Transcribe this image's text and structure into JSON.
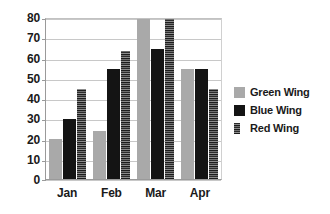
{
  "chart_data": {
    "type": "bar",
    "title": "",
    "subtitle": "",
    "xlabel": "",
    "ylabel": "",
    "categories": [
      "Jan",
      "Feb",
      "Mar",
      "Apr"
    ],
    "series": [
      {
        "name": "Green Wing",
        "color": "#a9a9a9",
        "values": [
          20,
          24,
          80,
          55
        ]
      },
      {
        "name": "Blue Wing",
        "color": "#141414",
        "values": [
          30,
          55,
          65,
          55
        ]
      },
      {
        "name": "Red Wing",
        "color": "#242424",
        "values": [
          45,
          64,
          80,
          45
        ]
      }
    ],
    "ylim": [
      0,
      80
    ],
    "ytick_values": [
      0,
      10,
      20,
      30,
      40,
      50,
      60,
      70,
      80
    ],
    "ytick_labels": [
      "0",
      "10",
      "20",
      "30",
      "40",
      "50",
      "60",
      "70",
      "80"
    ],
    "grid": true,
    "grid_axis": "y",
    "legend_position": "right"
  }
}
